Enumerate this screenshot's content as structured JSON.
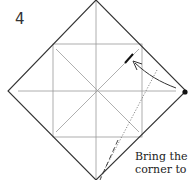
{
  "diagram": {
    "step_number": "4",
    "caption_lines": [
      "Bring the",
      "corner to"
    ],
    "colors": {
      "outline": "#333333",
      "crease": "#999999",
      "ink": "#111111"
    }
  }
}
